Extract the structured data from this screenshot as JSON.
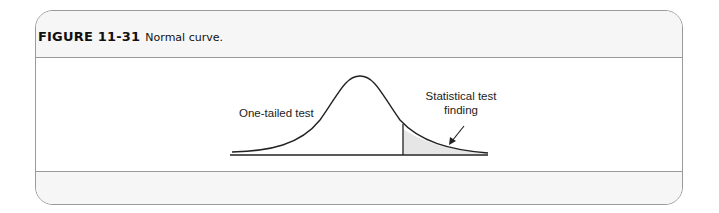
{
  "figure": {
    "number": "FIGURE 11-31",
    "caption": "Normal curve."
  },
  "diagram": {
    "left_label": "One-tailed test",
    "right_label_line1": "Statistical test",
    "right_label_line2": "finding",
    "shade_color": "#e6e6e6",
    "line_color": "#222222"
  }
}
